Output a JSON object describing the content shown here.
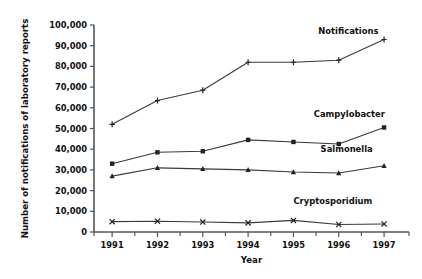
{
  "chart_data": {
    "type": "line",
    "title": "",
    "xlabel": "Year",
    "ylabel": "Number of notifications of laboratory reports",
    "x": [
      1991,
      1992,
      1993,
      1994,
      1995,
      1996,
      1997
    ],
    "xtick_labels": [
      "1991",
      "1992",
      "1993",
      "1994",
      "1995",
      "1996",
      "1997"
    ],
    "xlim": [
      1990.6,
      1997.55
    ],
    "ylim": [
      0,
      100000
    ],
    "ytick_values": [
      0,
      10000,
      20000,
      30000,
      40000,
      50000,
      60000,
      70000,
      80000,
      90000,
      100000
    ],
    "ytick_labels": [
      "0",
      "10,000",
      "20,000",
      "30,000",
      "40,000",
      "50,000",
      "60,000",
      "70,000",
      "80,000",
      "90,000",
      "100,000"
    ],
    "grid": false,
    "legend_position": "inline-right-of-series",
    "series": [
      {
        "name": "Notifications",
        "marker": "plus",
        "color": "#3a3a3a",
        "label_x": 1995.55,
        "label_y": 95500,
        "values": [
          52000,
          63500,
          68500,
          82000,
          82000,
          83000,
          93000
        ]
      },
      {
        "name": "Campylobacter",
        "marker": "square",
        "color": "#3a3a3a",
        "label_x": 1995.45,
        "label_y": 55500,
        "values": [
          33000,
          38500,
          39000,
          44500,
          43500,
          42500,
          50500
        ]
      },
      {
        "name": "Salmonella",
        "marker": "triangle",
        "color": "#3a3a3a",
        "label_x": 1995.6,
        "label_y": 38500,
        "values": [
          27000,
          31000,
          30500,
          30000,
          29000,
          28500,
          32000
        ]
      },
      {
        "name": "Cryptosporidium",
        "marker": "cross",
        "color": "#3a3a3a",
        "label_x": 1995.0,
        "label_y": 13500,
        "values": [
          5000,
          5200,
          4800,
          4400,
          5600,
          3600,
          3900
        ]
      }
    ]
  }
}
